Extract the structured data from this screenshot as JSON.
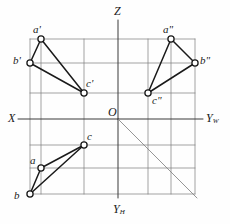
{
  "figure": {
    "type": "orthographic-projection-diagram",
    "canvas": {
      "width": 230,
      "height": 224
    },
    "origin": {
      "x": 118,
      "y": 119
    },
    "colors": {
      "stroke": "#1a1a1a",
      "grid": "#7b7b7b",
      "axis": "#3a3a3a",
      "node_fill": "#ffffff",
      "background": "#fefefe"
    }
  },
  "axes": [
    {
      "key": "X",
      "label": "X",
      "sub": "",
      "label_x": 8,
      "label_y": 112,
      "x1": 18,
      "y1": 119,
      "x2": 118,
      "y2": 119
    },
    {
      "key": "Z",
      "label": "Z",
      "sub": "",
      "label_x": 114,
      "label_y": 5,
      "x1": 118,
      "y1": 20,
      "x2": 118,
      "y2": 119
    },
    {
      "key": "YW",
      "label": "Y",
      "sub": "W",
      "label_x": 206,
      "label_y": 112,
      "x1": 118,
      "y1": 119,
      "x2": 203,
      "y2": 119
    },
    {
      "key": "YH",
      "label": "Y",
      "sub": "H",
      "label_x": 113,
      "label_y": 203,
      "x1": 118,
      "y1": 119,
      "x2": 118,
      "y2": 198
    },
    {
      "key": "O",
      "label": "O",
      "sub": "",
      "label_x": 108,
      "label_y": 106,
      "x1": 0,
      "y1": 0,
      "x2": 0,
      "y2": 0
    }
  ],
  "bisector": {
    "name": "45-degree-bisector",
    "x1": 118,
    "y1": 119,
    "x2": 197,
    "y2": 198
  },
  "views": [
    {
      "key": "front",
      "name": "front-view-V",
      "points": [
        {
          "key": "a1",
          "label": "a'",
          "x": 41,
          "y": 39,
          "label_x": 33,
          "label_y": 24
        },
        {
          "key": "b1",
          "label": "b'",
          "x": 30,
          "y": 63,
          "label_x": 13,
          "label_y": 55
        },
        {
          "key": "c1",
          "label": "c'",
          "x": 84,
          "y": 93,
          "label_x": 86,
          "label_y": 78
        }
      ],
      "edges": [
        [
          "a1",
          "b1"
        ],
        [
          "b1",
          "c1"
        ],
        [
          "c1",
          "a1"
        ]
      ]
    },
    {
      "key": "side",
      "name": "side-view-W",
      "points": [
        {
          "key": "a2",
          "label": "a\"",
          "x": 171,
          "y": 39,
          "label_x": 163,
          "label_y": 24
        },
        {
          "key": "b2",
          "label": "b\"",
          "x": 195,
          "y": 63,
          "label_x": 200,
          "label_y": 55
        },
        {
          "key": "c2",
          "label": "c\"",
          "x": 148,
          "y": 93,
          "label_x": 152,
          "label_y": 95
        }
      ],
      "edges": [
        [
          "a2",
          "b2"
        ],
        [
          "b2",
          "c2"
        ],
        [
          "c2",
          "a2"
        ]
      ]
    },
    {
      "key": "top",
      "name": "top-view-H",
      "points": [
        {
          "key": "a3",
          "label": "a",
          "x": 41,
          "y": 168,
          "label_x": 30,
          "label_y": 155
        },
        {
          "key": "b3",
          "label": "b",
          "x": 30,
          "y": 194,
          "label_x": 14,
          "label_y": 190
        },
        {
          "key": "c3",
          "label": "c",
          "x": 84,
          "y": 145,
          "label_x": 87,
          "label_y": 131
        }
      ],
      "edges": [
        [
          "a3",
          "b3"
        ],
        [
          "b3",
          "c3"
        ],
        [
          "c3",
          "a3"
        ]
      ]
    }
  ],
  "projection_lines": {
    "name": "projection-construction-lines",
    "horizontal": [
      {
        "y": 39,
        "x1": 30,
        "x2": 195
      },
      {
        "y": 63,
        "x1": 30,
        "x2": 195
      },
      {
        "y": 93,
        "x1": 30,
        "x2": 195
      },
      {
        "y": 145,
        "x1": 30,
        "x2": 195
      },
      {
        "y": 168,
        "x1": 30,
        "x2": 195
      },
      {
        "y": 194,
        "x1": 30,
        "x2": 195
      }
    ],
    "vertical": [
      {
        "x": 30,
        "y1": 39,
        "y2": 194
      },
      {
        "x": 41,
        "y1": 39,
        "y2": 194
      },
      {
        "x": 84,
        "y1": 39,
        "y2": 194
      },
      {
        "x": 148,
        "y1": 39,
        "y2": 194
      },
      {
        "x": 171,
        "y1": 39,
        "y2": 194
      },
      {
        "x": 195,
        "y1": 39,
        "y2": 194
      }
    ]
  }
}
